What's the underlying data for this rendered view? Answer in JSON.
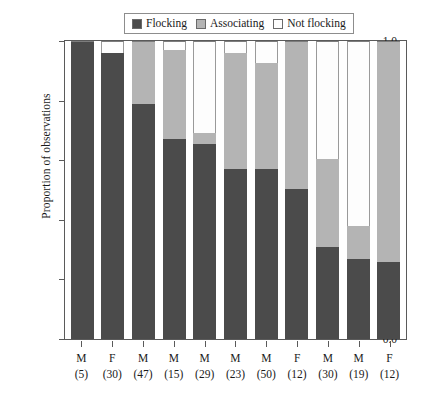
{
  "chart_data": {
    "type": "bar",
    "subtype": "stacked-proportional",
    "title": "",
    "xlabel": "",
    "ylabel": "Proportion of observations",
    "ylim": [
      0.0,
      1.0
    ],
    "yticks": [
      "1.0",
      "0.8",
      "0.6",
      "0.4",
      "0.2",
      "0.0"
    ],
    "ytick_values": [
      1.0,
      0.8,
      0.6,
      0.4,
      0.2,
      0.0
    ],
    "grid": false,
    "legend_position": "top-center",
    "categories": [
      "M\n(5)",
      "F\n(30)",
      "M\n(47)",
      "M\n(15)",
      "M\n(29)",
      "M\n(23)",
      "M\n(50)",
      "F\n(12)",
      "M\n(30)",
      "M\n(19)",
      "F\n(12)"
    ],
    "category_sex": [
      "M",
      "F",
      "M",
      "M",
      "M",
      "M",
      "M",
      "F",
      "M",
      "M",
      "F"
    ],
    "category_n": [
      "(5)",
      "(30)",
      "(47)",
      "(15)",
      "(29)",
      "(23)",
      "(50)",
      "(12)",
      "(30)",
      "(19)",
      "(12)"
    ],
    "series": [
      {
        "name": "Flocking",
        "color": "#4b4b4b",
        "values": [
          1.0,
          0.96,
          0.79,
          0.67,
          0.655,
          0.57,
          0.57,
          0.505,
          0.31,
          0.27,
          0.26
        ]
      },
      {
        "name": "Associating",
        "color": "#b4b4b4",
        "values": [
          0.0,
          0.0,
          0.21,
          0.3,
          0.035,
          0.39,
          0.355,
          0.495,
          0.295,
          0.11,
          0.74
        ]
      },
      {
        "name": "Not flocking",
        "color": "#fdfdfd",
        "values": [
          0.0,
          0.04,
          0.0,
          0.03,
          0.31,
          0.04,
          0.075,
          0.0,
          0.395,
          0.62,
          0.0
        ]
      }
    ]
  },
  "legend": {
    "entries": [
      {
        "label": "Flocking",
        "color": "#4b4b4b"
      },
      {
        "label": "Associating",
        "color": "#b4b4b4"
      },
      {
        "label": "Not flocking",
        "color": "#fdfdfd"
      }
    ]
  },
  "axes": {
    "y_title": "Proportion of observations",
    "y_ticks": [
      "1.0",
      "0.8",
      "0.6",
      "0.4",
      "0.2",
      "0.0"
    ]
  }
}
